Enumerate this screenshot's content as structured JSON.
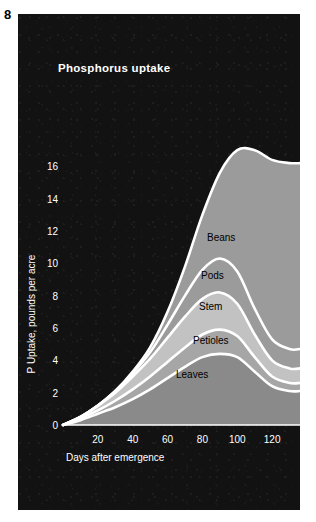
{
  "figure": {
    "number": "8"
  },
  "chart_data": {
    "type": "area",
    "title": "Phosphorus uptake",
    "xlabel": "Days after emergence",
    "ylabel": "P Uptake, pounds per acre",
    "xlim": [
      0,
      136
    ],
    "ylim": [
      0,
      18
    ],
    "xticks": [
      20,
      40,
      60,
      80,
      100,
      120
    ],
    "yticks": [
      0,
      2,
      4,
      6,
      8,
      10,
      12,
      14,
      16
    ],
    "grid": false,
    "legend": "inline-labels",
    "stacked": true,
    "x": [
      0,
      10,
      20,
      30,
      40,
      50,
      60,
      70,
      80,
      90,
      100,
      110,
      120,
      130,
      136
    ],
    "series": [
      {
        "name": "Leaves",
        "color": "#8a8a8a",
        "values": [
          0,
          0.3,
          0.7,
          1.1,
          1.6,
          2.2,
          2.9,
          3.6,
          4.2,
          4.4,
          4.2,
          3.3,
          2.4,
          2.1,
          2.1
        ]
      },
      {
        "name": "Petioles",
        "color": "#a6a6a6",
        "values": [
          0,
          0.1,
          0.2,
          0.4,
          0.6,
          0.8,
          1.0,
          1.2,
          1.4,
          1.5,
          1.3,
          0.9,
          0.6,
          0.5,
          0.5
        ]
      },
      {
        "name": "Stem",
        "color": "#c2c2c2",
        "values": [
          0,
          0.1,
          0.3,
          0.5,
          0.8,
          1.1,
          1.5,
          1.9,
          2.2,
          2.3,
          2.0,
          1.4,
          1.0,
          0.9,
          0.9
        ]
      },
      {
        "name": "Pods",
        "color": "#9b9b9b",
        "values": [
          0,
          0.0,
          0.0,
          0.1,
          0.2,
          0.4,
          0.8,
          1.3,
          1.8,
          2.1,
          2.0,
          1.6,
          1.3,
          1.2,
          1.2
        ]
      },
      {
        "name": "Beans",
        "color": "#9b9b9b",
        "values": [
          0,
          0.0,
          0.0,
          0.0,
          0.1,
          0.3,
          0.8,
          1.8,
          3.4,
          5.3,
          7.5,
          9.8,
          11.1,
          11.5,
          11.5
        ]
      }
    ],
    "series_totals_top": [
      0,
      0.5,
      1.2,
      2.1,
      3.3,
      4.8,
      7.0,
      9.8,
      13.0,
      15.6,
      17.0,
      17.0,
      16.4,
      16.2,
      16.2
    ],
    "label_positions": [
      {
        "name": "Beans",
        "x_px": 207,
        "y_px": 241
      },
      {
        "name": "Pods",
        "x_px": 201,
        "y_px": 279
      },
      {
        "name": "Stem",
        "x_px": 199,
        "y_px": 310
      },
      {
        "name": "Petioles",
        "x_px": 193,
        "y_px": 344
      },
      {
        "name": "Leaves",
        "x_px": 176,
        "y_px": 378
      }
    ]
  },
  "colors": {
    "panel_background": "#121212",
    "axis": "#ffffff",
    "outline": "#ffffff",
    "page_background": "#ffffff"
  }
}
